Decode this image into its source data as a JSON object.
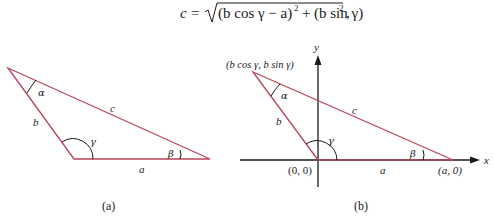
{
  "formula": {
    "lhs": "c",
    "eq": "=",
    "term1": "(b cos γ − a)",
    "exp1": "2",
    "plus": "+",
    "term2": "(b sin γ)",
    "exp2": "2",
    "trail": ","
  },
  "figure_a": {
    "caption": "(a)",
    "side_a": "a",
    "side_b": "b",
    "side_c": "c",
    "angle_alpha": "α",
    "angle_beta": "β",
    "angle_gamma": "γ"
  },
  "figure_b": {
    "caption": "(b)",
    "side_a": "a",
    "side_b": "b",
    "side_c": "c",
    "angle_alpha": "α",
    "angle_beta": "β",
    "angle_gamma": "γ",
    "vertex_apex": "(b  cos γ, b  sin γ)",
    "vertex_origin": "(0, 0)",
    "vertex_a": "(a, 0)",
    "axis_x": "x",
    "axis_y": "y"
  },
  "colors": {
    "triangle_line": "#b8475a",
    "axis_line": "#1a1a1a"
  }
}
